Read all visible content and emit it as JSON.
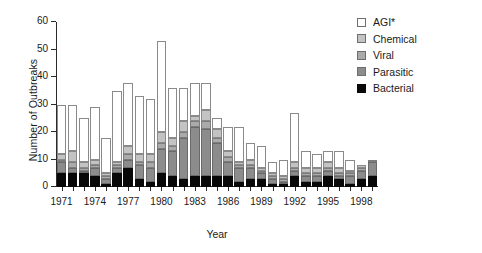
{
  "chart_data": {
    "type": "bar",
    "subtype": "stacked-vertical",
    "title": "",
    "xlabel": "Year",
    "ylabel": "Number of Outbreaks",
    "ylim": [
      0,
      60
    ],
    "ytick_values": [
      0,
      10,
      20,
      30,
      40,
      50,
      60
    ],
    "ytick_labels": [
      "0",
      "10",
      "20",
      "30",
      "40",
      "50",
      "60"
    ],
    "grid": false,
    "legend_position": "top-right",
    "categories": [
      "1971",
      "1972",
      "1973",
      "1974",
      "1975",
      "1976",
      "1977",
      "1978",
      "1979",
      "1980",
      "1981",
      "1982",
      "1983",
      "1984",
      "1985",
      "1986",
      "1987",
      "1988",
      "1989",
      "1990",
      "1991",
      "1992",
      "1993",
      "1994",
      "1995",
      "1996",
      "1997",
      "1998",
      "1999"
    ],
    "xtick_labels": [
      "1971",
      "1974",
      "1977",
      "1980",
      "1983",
      "1986",
      "1989",
      "1992",
      "1995",
      "1998"
    ],
    "series": [
      {
        "name": "Bacterial",
        "color": "#080808",
        "values": [
          5,
          5,
          5,
          4,
          1,
          5,
          7,
          3,
          2,
          5,
          4,
          3,
          4,
          4,
          4,
          4,
          2,
          3,
          3,
          1,
          1,
          4,
          2,
          2,
          4,
          3,
          1,
          3,
          4
        ]
      },
      {
        "name": "Parasitic",
        "color": "#8c8c8c",
        "values": [
          4,
          2,
          1,
          3,
          2,
          2,
          3,
          5,
          5,
          9,
          9,
          15,
          18,
          17,
          12,
          5,
          5,
          4,
          2,
          2,
          1,
          2,
          2,
          2,
          2,
          1,
          3,
          3,
          5
        ]
      },
      {
        "name": "Viral",
        "color": "#aaaaaa",
        "values": [
          1,
          2,
          1,
          1,
          1,
          1,
          2,
          1,
          2,
          2,
          2,
          2,
          2,
          3,
          2,
          2,
          1,
          1,
          1,
          1,
          1,
          1,
          1,
          1,
          1,
          1,
          1,
          1,
          1
        ]
      },
      {
        "name": "Chemical",
        "color": "#c3c3c3",
        "values": [
          2,
          4,
          2,
          2,
          1,
          1,
          3,
          3,
          3,
          4,
          3,
          4,
          2,
          4,
          3,
          2,
          1,
          2,
          1,
          1,
          1,
          2,
          2,
          2,
          2,
          2,
          1,
          1,
          0
        ]
      },
      {
        "name": "AGI*",
        "color": "#ffffff",
        "values": [
          18,
          17,
          16,
          19,
          13,
          26,
          23,
          21,
          20,
          33,
          18,
          12,
          12,
          10,
          4,
          9,
          13,
          6,
          8,
          4,
          6,
          18,
          6,
          5,
          4,
          6,
          4,
          0,
          0
        ]
      }
    ],
    "totals": [
      30,
      30,
      25,
      29,
      18,
      35,
      38,
      33,
      32,
      53,
      36,
      36,
      38,
      38,
      25,
      22,
      22,
      16,
      15,
      9,
      10,
      27,
      13,
      12,
      13,
      13,
      10,
      8,
      10
    ],
    "legend_entries": [
      {
        "label": "AGI*",
        "swatch": "agi"
      },
      {
        "label": "Chemical",
        "swatch": "chemical"
      },
      {
        "label": "Viral",
        "swatch": "viral"
      },
      {
        "label": "Parasitic",
        "swatch": "parasitic"
      },
      {
        "label": "Bacterial",
        "swatch": "bacterial"
      }
    ]
  }
}
